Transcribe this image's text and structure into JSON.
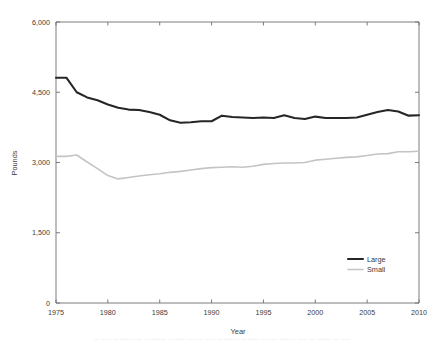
{
  "chart_data": {
    "type": "line",
    "title": "",
    "xlabel": "Year",
    "ylabel": "Pounds",
    "xlim": [
      1975,
      2010
    ],
    "ylim": [
      0,
      6000
    ],
    "grid": false,
    "legend_position": "bottom-right",
    "xticks": [
      "1975",
      "1980",
      "1985",
      "1990",
      "1995",
      "2000",
      "2005",
      "2010"
    ],
    "xtick_values": [
      1975,
      1980,
      1985,
      1990,
      1995,
      2000,
      2005,
      2010
    ],
    "yticks": [
      "0",
      "1,500",
      "3,000",
      "4,500",
      "6,000"
    ],
    "ytick_values": [
      0,
      1500,
      3000,
      4500,
      6000
    ],
    "x": [
      1975,
      1976,
      1977,
      1978,
      1979,
      1980,
      1981,
      1982,
      1983,
      1984,
      1985,
      1986,
      1987,
      1988,
      1989,
      1990,
      1991,
      1992,
      1993,
      1994,
      1995,
      1996,
      1997,
      1998,
      1999,
      2000,
      2001,
      2002,
      2003,
      2004,
      2005,
      2006,
      2007,
      2008,
      2009,
      2010
    ],
    "series": [
      {
        "name": "Large",
        "color": "#262626",
        "values": [
          4810,
          4810,
          4500,
          4390,
          4330,
          4240,
          4170,
          4130,
          4120,
          4080,
          4020,
          3900,
          3850,
          3860,
          3880,
          3880,
          4000,
          3970,
          3960,
          3950,
          3960,
          3950,
          4010,
          3950,
          3930,
          3980,
          3950,
          3950,
          3950,
          3960,
          4020,
          4080,
          4120,
          4090,
          4000,
          4010
        ]
      },
      {
        "name": "Small",
        "color": "#c4c4c4",
        "values": [
          3130,
          3130,
          3160,
          3010,
          2870,
          2720,
          2650,
          2680,
          2710,
          2740,
          2760,
          2790,
          2810,
          2840,
          2870,
          2890,
          2900,
          2910,
          2900,
          2920,
          2960,
          2980,
          2990,
          2990,
          3000,
          3050,
          3070,
          3090,
          3110,
          3120,
          3150,
          3180,
          3190,
          3230,
          3230,
          3240
        ]
      }
    ]
  },
  "legend": {
    "items": [
      {
        "label": "Large",
        "color": "#262626"
      },
      {
        "label": "Small",
        "color": "#c4c4c4"
      }
    ]
  },
  "caption": {
    "smudged_text": "— —— — —— —— — ——— — —— —— — —— — ——— — —— — —— —— — —— — ——— — ——"
  }
}
